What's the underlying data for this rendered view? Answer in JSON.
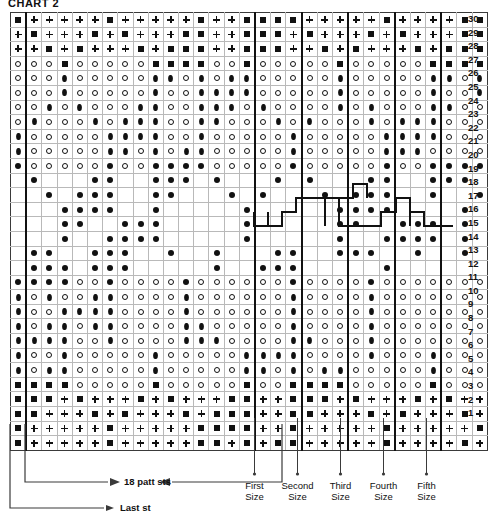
{
  "title": "CHART 2",
  "legend_symbols": {
    "square": "filled-square-stitch",
    "plus": "plus-stitch",
    "circle": "open-circle-stitch",
    "diamond": "filled-diamond-stitch",
    "dot": "filled-dot-stitch",
    "blank": "empty-cell"
  },
  "grid": {
    "columns": 31,
    "rows": 30,
    "size_separator_columns": [
      17,
      20,
      23,
      26,
      29
    ],
    "last_stitch_column": 1,
    "row_numbers": [
      30,
      29,
      28,
      27,
      26,
      25,
      24,
      23,
      22,
      21,
      20,
      19,
      18,
      17,
      16,
      15,
      14,
      13,
      12,
      11,
      10,
      9,
      8,
      7,
      6,
      5,
      4,
      3,
      2,
      1
    ]
  },
  "annotations": {
    "sizes": [
      {
        "label_line1": "First",
        "label_line2": "Size"
      },
      {
        "label_line1": "Second",
        "label_line2": "Size"
      },
      {
        "label_line1": "Third",
        "label_line2": "Size"
      },
      {
        "label_line1": "Fourth",
        "label_line2": "Size"
      },
      {
        "label_line1": "Fifth",
        "label_line2": "Size"
      }
    ],
    "patt_sts": "18 patt sts",
    "last_st": "Last st"
  },
  "chart_data": {
    "type": "table",
    "title": "CHART 2",
    "xlabel": "",
    "ylabel": "",
    "legend": [
      "filled-square-stitch",
      "plus-stitch",
      "open-circle-stitch",
      "filled-diamond-stitch",
      "filled-dot-stitch",
      "empty-cell"
    ],
    "categories": [
      "col1",
      "col2",
      "col3",
      "col4",
      "col5",
      "col6",
      "col7",
      "col8",
      "col9",
      "col10",
      "col11",
      "col12",
      "col13",
      "col14",
      "col15",
      "col16",
      "col17",
      "col18",
      "col19",
      "col20",
      "col21",
      "col22",
      "col23",
      "col24",
      "col25",
      "col26",
      "col27",
      "col28",
      "col29",
      "col30",
      "col31"
    ],
    "rows": [
      {
        "row": 30,
        "cells": [
          "S",
          "P",
          "P",
          "P",
          "P",
          "P",
          "S",
          "P",
          "P",
          "P",
          "P",
          "P",
          "S",
          "P",
          "P",
          "S",
          "S",
          "S",
          "S",
          "P",
          "P",
          "P",
          "P",
          "P",
          "S",
          "P",
          "P",
          "P",
          "P",
          "S",
          "S"
        ]
      },
      {
        "row": 29,
        "cells": [
          "P",
          "S",
          "P",
          "P",
          "P",
          "S",
          "P",
          "S",
          "P",
          "P",
          "P",
          "S",
          "S",
          "P",
          "P",
          "S",
          "S",
          "S",
          "P",
          "S",
          "P",
          "P",
          "P",
          "S",
          "P",
          "S",
          "P",
          "P",
          "P",
          "S",
          "S"
        ]
      },
      {
        "row": 28,
        "cells": [
          "P",
          "P",
          "S",
          "P",
          "S",
          "P",
          "P",
          "P",
          "S",
          "P",
          "S",
          "S",
          "S",
          "P",
          "P",
          "S",
          "S",
          "S",
          "P",
          "P",
          "S",
          "P",
          "S",
          "P",
          "P",
          "P",
          "S",
          "P",
          "S",
          "S",
          "S"
        ]
      },
      {
        "row": 27,
        "cells": [
          "C",
          "C",
          "C",
          "S",
          "C",
          "C",
          "C",
          "C",
          "C",
          "S",
          "S",
          "S",
          "S",
          "C",
          "C",
          "S",
          "C",
          "C",
          "C",
          "C",
          "C",
          "S",
          "C",
          "C",
          "C",
          "C",
          "C",
          "S",
          "S",
          "S",
          "S"
        ]
      },
      {
        "row": 26,
        "cells": [
          "C",
          "C",
          "C",
          "D",
          "C",
          "C",
          "C",
          "C",
          "C",
          "D",
          "D",
          "C",
          "D",
          "C",
          "D",
          "D",
          "C",
          "C",
          "C",
          "C",
          "C",
          "D",
          "C",
          "C",
          "C",
          "C",
          "C",
          "D",
          "D",
          "C",
          "D"
        ]
      },
      {
        "row": 25,
        "cells": [
          "C",
          "C",
          "C",
          "D",
          "C",
          "C",
          "C",
          "C",
          "C",
          "D",
          "C",
          "C",
          "D",
          "D",
          "D",
          "D",
          "C",
          "C",
          "C",
          "C",
          "C",
          "D",
          "C",
          "C",
          "C",
          "C",
          "C",
          "D",
          "C",
          "C",
          "D"
        ]
      },
      {
        "row": 24,
        "cells": [
          "C",
          "C",
          "D",
          "C",
          "D",
          "C",
          "C",
          "C",
          "D",
          "D",
          "C",
          "C",
          "D",
          "D",
          "D",
          "C",
          "D",
          "C",
          "C",
          "C",
          "C",
          "D",
          "C",
          "D",
          "C",
          "C",
          "C",
          "D",
          "D",
          "C",
          "C"
        ]
      },
      {
        "row": 23,
        "cells": [
          "C",
          "D",
          "C",
          "C",
          "C",
          "D",
          "C",
          "D",
          "D",
          "D",
          "C",
          "C",
          "D",
          "D",
          "C",
          "C",
          "C",
          "D",
          "C",
          "D",
          "C",
          "C",
          "C",
          "D",
          "C",
          "D",
          "D",
          "D",
          "C",
          "C",
          "C"
        ]
      },
      {
        "row": 22,
        "cells": [
          "D",
          "C",
          "C",
          "C",
          "C",
          "C",
          "D",
          "D",
          "D",
          "D",
          "C",
          "C",
          "D",
          "C",
          "C",
          "C",
          "C",
          "C",
          "D",
          "C",
          "C",
          "C",
          "C",
          "C",
          "D",
          "D",
          "D",
          "D",
          "C",
          "C",
          "C"
        ]
      },
      {
        "row": 21,
        "cells": [
          "D",
          "C",
          "C",
          "C",
          "C",
          "C",
          "D",
          "D",
          "C",
          "D",
          "C",
          "D",
          "D",
          "C",
          "C",
          "C",
          "C",
          "C",
          "D",
          "C",
          "C",
          "C",
          "C",
          "C",
          "D",
          "D",
          "D",
          "C",
          "C",
          "C",
          "C"
        ]
      },
      {
        "row": 20,
        "cells": [
          "O",
          "C",
          "C",
          "C",
          "C",
          "C",
          "O",
          "C",
          "C",
          "O",
          "O",
          "O",
          "O",
          "C",
          "C",
          "C",
          "C",
          "C",
          "O",
          "C",
          "C",
          "C",
          "C",
          "C",
          "O",
          "C",
          "C",
          "O",
          "O",
          "O",
          "O"
        ]
      },
      {
        "row": 19,
        "cells": [
          "B",
          "O",
          "B",
          "B",
          "B",
          "O",
          "O",
          "B",
          "B",
          "O",
          "O",
          "O",
          "B",
          "O",
          "B",
          "B",
          "B",
          "O",
          "B",
          "O",
          "B",
          "B",
          "B",
          "O",
          "O",
          "B",
          "B",
          "O",
          "O",
          "O",
          "B"
        ]
      },
      {
        "row": 18,
        "cells": [
          "B",
          "B",
          "O",
          "B",
          "O",
          "O",
          "O",
          "B",
          "B",
          "O",
          "O",
          "B",
          "B",
          "B",
          "O",
          "B",
          "O",
          "B",
          "B",
          "B",
          "O",
          "B",
          "O",
          "O",
          "O",
          "B",
          "B",
          "O",
          "B",
          "B",
          "O"
        ]
      },
      {
        "row": 17,
        "cells": [
          "B",
          "B",
          "B",
          "O",
          "O",
          "O",
          "O",
          "B",
          "B",
          "O",
          "B",
          "B",
          "B",
          "B",
          "B",
          "O",
          "B",
          "B",
          "B",
          "B",
          "B",
          "O",
          "O",
          "O",
          "O",
          "B",
          "B",
          "B",
          "B",
          "O",
          "B"
        ]
      },
      {
        "row": 16,
        "cells": [
          "B",
          "B",
          "B",
          "O",
          "O",
          "B",
          "B",
          "O",
          "O",
          "O",
          "B",
          "B",
          "B",
          "B",
          "B",
          "O",
          "B",
          "B",
          "B",
          "B",
          "B",
          "O",
          "O",
          "B",
          "B",
          "O",
          "O",
          "O",
          "B",
          "O",
          "B"
        ]
      },
      {
        "row": 15,
        "cells": [
          "B",
          "B",
          "B",
          "O",
          "B",
          "B",
          "O",
          "O",
          "O",
          "O",
          "B",
          "B",
          "B",
          "B",
          "B",
          "O",
          "B",
          "B",
          "B",
          "B",
          "B",
          "O",
          "B",
          "B",
          "O",
          "O",
          "O",
          "O",
          "B",
          "O",
          "B"
        ]
      },
      {
        "row": 14,
        "cells": [
          "B",
          "O",
          "O",
          "B",
          "B",
          "O",
          "O",
          "O",
          "B",
          "B",
          "O",
          "B",
          "B",
          "O",
          "B",
          "B",
          "B",
          "O",
          "O",
          "B",
          "B",
          "O",
          "O",
          "O",
          "B",
          "B",
          "O",
          "B",
          "B",
          "O",
          "B"
        ]
      },
      {
        "row": 13,
        "cells": [
          "B",
          "O",
          "O",
          "O",
          "B",
          "O",
          "O",
          "O",
          "B",
          "B",
          "B",
          "B",
          "B",
          "O",
          "B",
          "B",
          "O",
          "O",
          "O",
          "B",
          "B",
          "B",
          "B",
          "B",
          "O",
          "B",
          "B",
          "B",
          "B",
          "B",
          "B"
        ]
      },
      {
        "row": 12,
        "cells": [
          "O",
          "O",
          "O",
          "O",
          "C",
          "C",
          "O",
          "C",
          "C",
          "C",
          "C",
          "O",
          "C",
          "C",
          "C",
          "C",
          "C",
          "C",
          "O",
          "C",
          "C",
          "C",
          "C",
          "O",
          "C",
          "C",
          "C",
          "C",
          "C",
          "C",
          "C"
        ]
      },
      {
        "row": 11,
        "cells": [
          "D",
          "C",
          "D",
          "C",
          "C",
          "D",
          "D",
          "C",
          "C",
          "C",
          "C",
          "D",
          "C",
          "C",
          "C",
          "C",
          "C",
          "C",
          "D",
          "C",
          "C",
          "C",
          "C",
          "D",
          "C",
          "C",
          "C",
          "C",
          "C",
          "C",
          "C"
        ]
      },
      {
        "row": 10,
        "cells": [
          "D",
          "C",
          "C",
          "D",
          "D",
          "D",
          "D",
          "C",
          "C",
          "C",
          "C",
          "D",
          "C",
          "C",
          "C",
          "C",
          "C",
          "C",
          "D",
          "C",
          "C",
          "C",
          "C",
          "D",
          "C",
          "C",
          "C",
          "C",
          "C",
          "C",
          "C"
        ]
      },
      {
        "row": 9,
        "cells": [
          "D",
          "C",
          "D",
          "D",
          "C",
          "D",
          "D",
          "C",
          "C",
          "C",
          "C",
          "D",
          "D",
          "C",
          "C",
          "C",
          "C",
          "C",
          "D",
          "C",
          "C",
          "C",
          "C",
          "D",
          "C",
          "C",
          "C",
          "C",
          "C",
          "C",
          "C"
        ]
      },
      {
        "row": 8,
        "cells": [
          "D",
          "D",
          "D",
          "D",
          "C",
          "C",
          "D",
          "C",
          "C",
          "C",
          "C",
          "D",
          "D",
          "D",
          "C",
          "C",
          "C",
          "C",
          "D",
          "D",
          "C",
          "C",
          "C",
          "D",
          "C",
          "C",
          "C",
          "C",
          "C",
          "C",
          "C"
        ]
      },
      {
        "row": 7,
        "cells": [
          "D",
          "C",
          "C",
          "D",
          "C",
          "C",
          "C",
          "C",
          "C",
          "D",
          "C",
          "C",
          "C",
          "C",
          "C",
          "D",
          "D",
          "D",
          "D",
          "C",
          "C",
          "C",
          "C",
          "D",
          "C",
          "C",
          "C",
          "D",
          "C",
          "C",
          "C"
        ]
      },
      {
        "row": 6,
        "cells": [
          "D",
          "C",
          "D",
          "D",
          "C",
          "C",
          "C",
          "C",
          "C",
          "D",
          "C",
          "C",
          "C",
          "C",
          "C",
          "D",
          "D",
          "C",
          "D",
          "C",
          "D",
          "D",
          "C",
          "C",
          "C",
          "C",
          "C",
          "D",
          "C",
          "C",
          "C"
        ]
      },
      {
        "row": 5,
        "cells": [
          "S",
          "S",
          "S",
          "S",
          "C",
          "C",
          "C",
          "C",
          "C",
          "S",
          "C",
          "C",
          "C",
          "C",
          "C",
          "S",
          "C",
          "C",
          "S",
          "S",
          "S",
          "S",
          "C",
          "C",
          "C",
          "C",
          "C",
          "S",
          "C",
          "C",
          "C"
        ]
      },
      {
        "row": 4,
        "cells": [
          "S",
          "S",
          "S",
          "P",
          "S",
          "P",
          "P",
          "P",
          "S",
          "P",
          "S",
          "P",
          "P",
          "P",
          "S",
          "S",
          "P",
          "P",
          "S",
          "S",
          "S",
          "P",
          "S",
          "P",
          "P",
          "P",
          "S",
          "P",
          "S",
          "P",
          "P"
        ]
      },
      {
        "row": 3,
        "cells": [
          "S",
          "S",
          "P",
          "P",
          "P",
          "S",
          "P",
          "S",
          "P",
          "P",
          "P",
          "S",
          "P",
          "S",
          "S",
          "S",
          "P",
          "P",
          "S",
          "S",
          "P",
          "P",
          "P",
          "S",
          "P",
          "S",
          "P",
          "P",
          "P",
          "S",
          "P"
        ]
      },
      {
        "row": 2,
        "cells": [
          "S",
          "P",
          "P",
          "P",
          "P",
          "P",
          "S",
          "P",
          "P",
          "P",
          "P",
          "P",
          "S",
          "S",
          "S",
          "S",
          "P",
          "P",
          "S",
          "P",
          "P",
          "P",
          "P",
          "P",
          "S",
          "P",
          "P",
          "P",
          "P",
          "P",
          "S"
        ]
      },
      {
        "row": 1,
        "cells": [
          "S",
          "P",
          "P",
          "P",
          "P",
          "P",
          "S",
          "P",
          "P",
          "P",
          "P",
          "P",
          "S",
          "S",
          "P",
          "S",
          "P",
          "S",
          "S",
          "P",
          "P",
          "P",
          "P",
          "P",
          "S",
          "P",
          "P",
          "P",
          "P",
          "S",
          "P"
        ]
      }
    ]
  }
}
